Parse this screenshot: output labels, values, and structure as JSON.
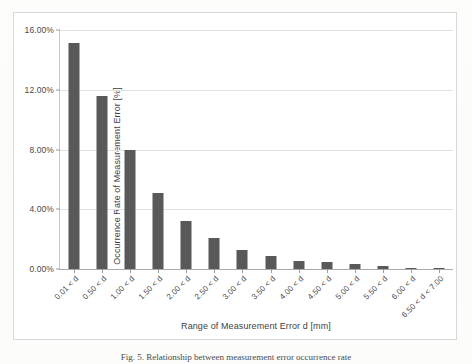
{
  "chart_data": {
    "type": "bar",
    "title": "",
    "xlabel": "Range of Measurement Error d [mm]",
    "ylabel": "Occurrence Rate of Measurement Error [%]",
    "ylim": [
      0,
      16
    ],
    "ytick_values": [
      0,
      4,
      8,
      12,
      16
    ],
    "ytick_labels": [
      "0.00%",
      "4.00%",
      "8.00%",
      "12.00%",
      "16.00%"
    ],
    "grid": "horizontal",
    "legend": "none",
    "bar_color": "#595959",
    "categories": [
      "0.01 < d",
      "0.50 < d",
      "1.00 < d",
      "1.50 < d",
      "2.00 < d",
      "2.50 < d",
      "3.00 < d",
      "3.50 < d",
      "4.00 < d",
      "4.50 < d",
      "5.00 < d",
      "5.50 < d",
      "6.00 < d",
      "6.50 < d < 7.00"
    ],
    "values": [
      15.1,
      11.6,
      7.95,
      5.1,
      3.2,
      2.05,
      1.3,
      0.85,
      0.55,
      0.45,
      0.35,
      0.2,
      0.1,
      0.08
    ]
  },
  "caption": {
    "text": "Fig. 5.  Relationship between measurement error occurrence rate"
  }
}
